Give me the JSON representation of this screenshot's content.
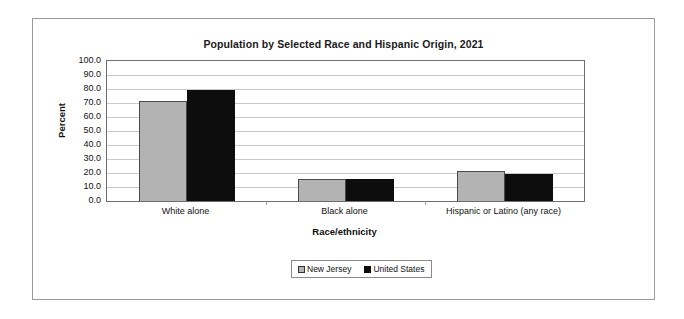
{
  "chart_data": {
    "type": "bar",
    "title": "Population by Selected Race and Hispanic Origin, 2021",
    "xlabel": "Race/ethnicity",
    "ylabel": "Percent",
    "ylim": [
      0,
      100
    ],
    "ytick_step": 10,
    "ytick_labels": [
      "100.0",
      "90.0",
      "80.0",
      "70.0",
      "60.0",
      "50.0",
      "40.0",
      "30.0",
      "20.0",
      "10.0",
      "0.0"
    ],
    "grid": true,
    "legend_position": "bottom-center",
    "categories": [
      "White alone",
      "Black alone",
      "Hispanic or Latino (any race)"
    ],
    "series": [
      {
        "name": "New Jersey",
        "color": "#b3b3b3",
        "values": [
          71.5,
          15.4,
          21.4
        ]
      },
      {
        "name": "United States",
        "color": "#0d0d0d",
        "values": [
          79.0,
          15.4,
          19.3
        ]
      }
    ]
  },
  "legend": {
    "items": [
      {
        "label": "New Jersey"
      },
      {
        "label": "United States"
      }
    ]
  }
}
